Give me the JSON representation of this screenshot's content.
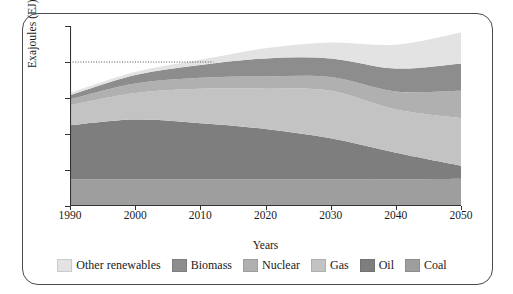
{
  "chart_data": {
    "type": "area",
    "stacked": true,
    "title": "",
    "xlabel": "Years",
    "ylabel": "Exajoules (EJ)",
    "x": [
      1990,
      2000,
      2010,
      2020,
      2030,
      2040,
      2050
    ],
    "xlim": [
      1990,
      2050
    ],
    "ylim": [
      0,
      250
    ],
    "xticks": [
      "1990",
      "2000",
      "2010",
      "2020",
      "2030",
      "2040",
      "2050"
    ],
    "yticks": [
      "0",
      "50",
      "100",
      "150",
      "200",
      "250"
    ],
    "grid": false,
    "legend_position": "bottom",
    "reference_line": {
      "value": 200,
      "style": "dotted",
      "extent_x": [
        1990,
        2012
      ]
    },
    "series": [
      {
        "name": "Coal",
        "color": "#9e9e9e",
        "values": [
          37,
          37,
          37,
          37,
          37,
          37,
          38
        ]
      },
      {
        "name": "Oil",
        "color": "#7e7e7e",
        "values": [
          75,
          83,
          78,
          70,
          57,
          37,
          18
        ]
      },
      {
        "name": "Gas",
        "color": "#c3c3c3",
        "values": [
          28,
          37,
          48,
          56,
          66,
          60,
          66
        ]
      },
      {
        "name": "Nuclear",
        "color": "#b0b0b0",
        "values": [
          8,
          13,
          15,
          17,
          19,
          25,
          38
        ]
      },
      {
        "name": "Biomass",
        "color": "#8d8d8d",
        "values": [
          6,
          12,
          18,
          25,
          26,
          32,
          38
        ]
      },
      {
        "name": "Other renewables",
        "color": "#e3e3e3",
        "values": [
          3,
          4,
          7,
          14,
          22,
          33,
          43
        ]
      }
    ],
    "totals": [
      157,
      186,
      203,
      219,
      227,
      224,
      241
    ]
  },
  "legend": {
    "items": [
      {
        "label": "Other renewables",
        "color": "#e3e3e3"
      },
      {
        "label": "Biomass",
        "color": "#8d8d8d"
      },
      {
        "label": "Nuclear",
        "color": "#b0b0b0"
      },
      {
        "label": "Gas",
        "color": "#c3c3c3"
      },
      {
        "label": "Oil",
        "color": "#7e7e7e"
      },
      {
        "label": "Coal",
        "color": "#9e9e9e"
      }
    ]
  }
}
